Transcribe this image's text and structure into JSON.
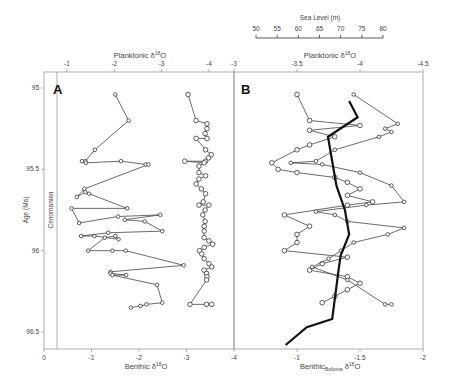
{
  "figure": {
    "panel_a_label": "A",
    "panel_b_label": "B",
    "y_axis_label": "Age (Ma)",
    "stage_label": "Cenomanian",
    "panel_a_top_label": "Planktonic δ18O",
    "panel_a_bottom_label": "Benthic δ18O",
    "panel_b_top_label": "Planktonic δ18O",
    "panel_b_bottom_label": "Benthic",
    "panel_b_bottom_sub": "Bolivina",
    "panel_b_bottom_suffix": "δ18O",
    "sea_level_label": "Sea Level (m)"
  },
  "chart_data": [
    {
      "type": "line",
      "panel": "A",
      "ylabel": "Age (Ma)",
      "yticks": [
        95,
        95.5,
        96,
        96.5
      ],
      "ylim": [
        94.9,
        96.6
      ],
      "top_axis": {
        "label": "Planktonic δ18O",
        "ticks": [
          -1,
          -2,
          -3,
          -4
        ]
      },
      "bottom_axis": {
        "label": "Benthic δ18O",
        "ticks": [
          0,
          -1,
          -2,
          -3,
          -4
        ]
      },
      "annotation": "Cenomanian",
      "series": [
        {
          "name": "Benthic δ18O",
          "marker": "circle-small",
          "x": [
            -1.5,
            -1.78,
            -1.07,
            -0.87,
            -0.8,
            -0.88,
            -1.62,
            -2.14,
            -2.2,
            -0.85,
            -0.69,
            -0.87,
            -0.95,
            -1.75,
            -0.58,
            -0.74,
            -1.56,
            -2.45,
            -1.7,
            -2.12,
            -2.49,
            -1.35,
            -0.78,
            -1.06,
            -1.57,
            -1.5,
            -1.28,
            -0.93,
            -1.44,
            -1.72,
            -2.94,
            -1.4,
            -1.4,
            -1.73,
            -1.44,
            -2.38,
            -2.49,
            -2.16,
            -2.03,
            -1.83
          ],
          "age": [
            95.04,
            95.2,
            95.38,
            95.45,
            95.45,
            95.46,
            95.45,
            95.47,
            95.47,
            95.62,
            95.67,
            95.64,
            95.65,
            95.74,
            95.74,
            95.83,
            95.79,
            95.78,
            95.81,
            95.82,
            95.88,
            95.89,
            95.91,
            95.91,
            95.93,
            95.91,
            95.92,
            96.0,
            96.0,
            96.0,
            96.09,
            96.13,
            96.14,
            96.15,
            96.15,
            96.21,
            96.32,
            96.33,
            96.34,
            96.35
          ]
        },
        {
          "name": "Planktonic δ18O",
          "marker": "circle-open",
          "x": [
            -3.56,
            -3.73,
            -3.96,
            -3.96,
            -3.92,
            -3.96,
            -3.73,
            -3.93,
            -4.05,
            -3.99,
            -3.93,
            -3.49,
            -3.9,
            -3.79,
            -3.79,
            -3.93,
            -3.79,
            -3.73,
            -3.84,
            -3.93,
            -3.88,
            -3.79,
            -4.0,
            -3.92,
            -3.87,
            -3.92,
            -3.9,
            -3.9,
            -3.9,
            -4.0,
            -4.08,
            -3.9,
            -3.8,
            -3.85,
            -3.9,
            -4.0,
            -4.06,
            -3.9,
            -3.95,
            -3.96,
            -3.95,
            -3.6,
            -3.95,
            -4.06
          ],
          "age": [
            95.04,
            95.2,
            95.22,
            95.25,
            95.28,
            95.31,
            95.31,
            95.38,
            95.41,
            95.43,
            95.45,
            95.45,
            95.46,
            95.48,
            95.52,
            95.54,
            95.56,
            95.59,
            95.62,
            95.65,
            95.7,
            95.72,
            95.72,
            95.75,
            95.78,
            95.82,
            95.85,
            95.88,
            95.92,
            95.94,
            95.96,
            95.98,
            96.0,
            96.02,
            96.05,
            96.08,
            96.1,
            96.12,
            96.14,
            96.16,
            96.18,
            96.33,
            96.33,
            96.33
          ]
        }
      ]
    },
    {
      "type": "line",
      "panel": "B",
      "ylim": [
        94.9,
        96.6
      ],
      "top_axis": {
        "label": "Planktonic δ18O",
        "ticks": [
          -3,
          -3.5,
          -4,
          -4.5
        ]
      },
      "bottom_axis": {
        "label": "Benthic Bolivina δ18O",
        "ticks": [
          -1,
          -1.5,
          -2
        ]
      },
      "sea_level_axis": {
        "label": "Sea Level (m)",
        "ticks": [
          50,
          55,
          60,
          65,
          70,
          75,
          80
        ]
      },
      "series": [
        {
          "name": "Planktonic δ18O",
          "marker": "circle-open",
          "x": [
            -3.5,
            -3.6,
            -4.0,
            -3.6,
            -3.8,
            -3.6,
            -3.5,
            -3.3,
            -3.35,
            -3.5,
            -3.8,
            -3.9,
            -4.0,
            -3.9,
            -4.1,
            -3.9,
            -3.4,
            -3.6,
            -3.5,
            -3.5,
            -3.4,
            -3.9,
            -3.7,
            -3.6,
            -3.9,
            -4.0,
            -3.9,
            -3.8,
            -3.7
          ],
          "age": [
            95.04,
            95.2,
            95.23,
            95.26,
            95.3,
            95.35,
            95.38,
            95.46,
            95.5,
            95.52,
            95.55,
            95.58,
            95.62,
            95.66,
            95.7,
            95.72,
            95.78,
            95.85,
            95.9,
            95.95,
            96.0,
            96.04,
            96.08,
            96.12,
            96.16,
            96.2,
            96.24,
            96.28,
            96.32
          ]
        },
        {
          "name": "Benthic Bolivina δ18O",
          "marker": "circle-small",
          "x": [
            -1.45,
            -1.8,
            -1.7,
            -1.75,
            -1.65,
            -1.3,
            -1.15,
            -0.95,
            -1.2,
            -1.5,
            -1.75,
            -1.85,
            -1.55,
            -1.15,
            -1.3,
            -1.4,
            -1.85,
            -1.72,
            -1.45,
            -1.35,
            -1.25,
            -1.12,
            -1.4,
            -1.7,
            -1.75
          ],
          "age": [
            95.04,
            95.22,
            95.25,
            95.27,
            95.3,
            95.38,
            95.45,
            95.46,
            95.47,
            95.52,
            95.6,
            95.7,
            95.72,
            95.76,
            95.78,
            95.82,
            95.86,
            95.9,
            95.95,
            96.0,
            96.05,
            96.1,
            96.18,
            96.33,
            96.33
          ]
        },
        {
          "name": "Sea Level (m)",
          "style": "thick-black",
          "x": [
            72,
            74,
            67,
            68,
            69,
            71,
            72,
            70,
            69.5,
            68,
            62,
            57
          ],
          "age": [
            95.08,
            95.18,
            95.3,
            95.45,
            95.6,
            95.75,
            95.9,
            96.03,
            96.12,
            96.42,
            96.47,
            96.58
          ]
        }
      ]
    }
  ]
}
